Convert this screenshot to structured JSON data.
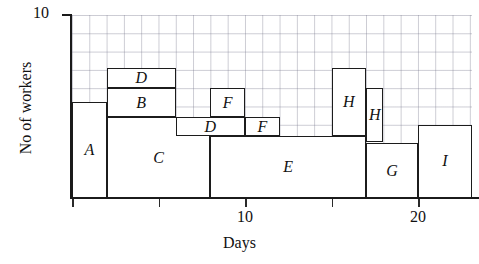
{
  "chart_data": {
    "type": "bar",
    "title": "",
    "xlabel": "Days",
    "ylabel": "No of workers",
    "xlim": [
      0,
      23.1
    ],
    "ylim": [
      0,
      10
    ],
    "grid": true,
    "legend": "none",
    "x_ticks": [
      {
        "value": 0,
        "label": ""
      },
      {
        "value": 5,
        "label": ""
      },
      {
        "value": 10,
        "label": "10"
      },
      {
        "value": 15,
        "label": ""
      },
      {
        "value": 20,
        "label": "20"
      }
    ],
    "y_ticks": [
      {
        "value": 10,
        "label": "10"
      }
    ],
    "blocks": [
      {
        "label": "A",
        "x_start": 0,
        "x_end": 2,
        "y_bottom": 0,
        "y_top": 5.25
      },
      {
        "label": "D",
        "x_start": 2,
        "x_end": 6,
        "y_bottom": 6.0,
        "y_top": 7.1
      },
      {
        "label": "B",
        "x_start": 2,
        "x_end": 6,
        "y_bottom": 4.4,
        "y_top": 6.0
      },
      {
        "label": "C",
        "x_start": 2,
        "x_end": 8,
        "y_bottom": 0,
        "y_top": 4.4
      },
      {
        "label": "D",
        "x_start": 6,
        "x_end": 10,
        "y_bottom": 3.4,
        "y_top": 4.4
      },
      {
        "label": "F",
        "x_start": 8,
        "x_end": 10,
        "y_bottom": 4.4,
        "y_top": 6.0
      },
      {
        "label": "F",
        "x_start": 10,
        "x_end": 12,
        "y_bottom": 3.4,
        "y_top": 4.4
      },
      {
        "label": "E",
        "x_start": 8,
        "x_end": 17,
        "y_bottom": 0,
        "y_top": 3.4
      },
      {
        "label": "H",
        "x_start": 15,
        "x_end": 17,
        "y_bottom": 3.4,
        "y_top": 7.1
      },
      {
        "label": "H",
        "x_start": 17,
        "x_end": 18,
        "y_bottom": 3.05,
        "y_top": 6.0
      },
      {
        "label": "G",
        "x_start": 17,
        "x_end": 20,
        "y_bottom": 0,
        "y_top": 3.0
      },
      {
        "label": "I",
        "x_start": 20,
        "x_end": 23.1,
        "y_bottom": 0,
        "y_top": 4.0
      }
    ]
  }
}
